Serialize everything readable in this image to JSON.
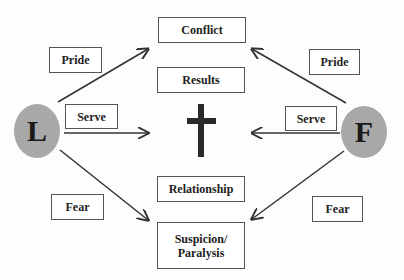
{
  "nodes": {
    "left_circle": "L",
    "right_circle": "F",
    "conflict": "Conflict",
    "results": "Results",
    "relationship": "Relationship",
    "suspicion_line1": "Suspicion/",
    "suspicion_line2": "Paralysis"
  },
  "labels": {
    "pride_left": "Pride",
    "pride_right": "Pride",
    "serve_left": "Serve",
    "serve_right": "Serve",
    "fear_left": "Fear",
    "fear_right": "Fear"
  },
  "center_symbol": "cross-icon",
  "colors": {
    "circle_fill": "#a8a8a8",
    "line": "#333333",
    "cross": "#2a2a2a"
  }
}
